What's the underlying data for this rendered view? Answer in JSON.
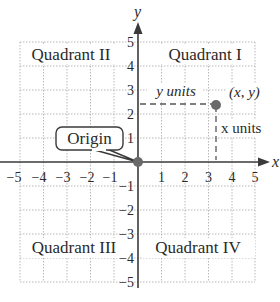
{
  "diagram": {
    "type": "coordinate-plane",
    "axes": {
      "x_label": "x",
      "y_label": "y",
      "x_range": [
        -5,
        5
      ],
      "y_range": [
        -5,
        5
      ],
      "x_ticks": [
        "−5",
        "−4",
        "−3",
        "−2",
        "−1",
        "1",
        "2",
        "3",
        "4",
        "5"
      ],
      "y_ticks": [
        "5",
        "4",
        "3",
        "2",
        "1",
        "−1",
        "−2",
        "−3",
        "−4",
        "−5"
      ]
    },
    "quadrants": {
      "q1": "Quadrant I",
      "q2": "Quadrant II",
      "q3": "Quadrant III",
      "q4": "Quadrant IV"
    },
    "origin_label": "Origin",
    "point": {
      "label": "(x, y)",
      "x": 3.3,
      "y": 2.5,
      "y_units_label": "y units",
      "x_units_label": "x units"
    },
    "colors": {
      "axis": "#3a3a3a",
      "grid": "#b8b8b8",
      "point": "#6a6a6a",
      "text": "#2a2a2a"
    }
  }
}
